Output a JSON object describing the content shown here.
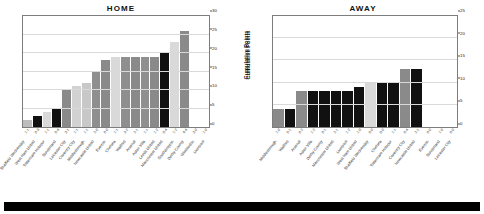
{
  "footer": {
    "bar_color": "#000000"
  },
  "axis": {
    "y_label": "Cumulative Points"
  },
  "chart_data": [
    {
      "type": "bar",
      "title": "HOME",
      "xlabel": "",
      "ylabel": "Cumulative Points",
      "ylim": [
        0,
        30
      ],
      "yticks": [
        0,
        5,
        10,
        15,
        20,
        25,
        30
      ],
      "grid": true,
      "legend": "none",
      "categories": [
        "Sheffield Wednesday",
        "West Ham United",
        "Tottenham Hotspur",
        "Sunderland",
        "Leicester City",
        "Coventry City",
        "Middlesbrough",
        "Newcastle United",
        "Everton",
        "Chelsea",
        "Watford",
        "Arsenal",
        "Aston Villa",
        "Leeds United",
        "Manchester United",
        "Southampton",
        "Derby County",
        "Wimbledon",
        "Liverpool"
      ],
      "scores": [
        "1-1",
        "0-3",
        "1-1",
        "0-4",
        "3-1",
        "1-1",
        "1-1",
        "2-0",
        "0-0",
        "1-1",
        "3-2",
        "2-1",
        "1-1",
        "1-2",
        "0-4",
        "1-2",
        "4-4",
        "3-0",
        "1-0"
      ],
      "values": [
        2,
        3,
        4,
        5,
        10,
        11,
        12,
        15,
        18,
        19,
        19,
        19,
        19,
        19,
        20,
        23,
        26,
        0,
        0
      ],
      "bar_colors": [
        "#bdbdbd",
        "#111111",
        "#d9d9d9",
        "#111111",
        "#8a8a8a",
        "#d2d2d2",
        "#c8c8c8",
        "#8f8f8f",
        "#8a8a8a",
        "#d9d9d9",
        "#8f8f8f",
        "#8a8a8a",
        "#8f8f8f",
        "#8a8a8a",
        "#111111",
        "#d9d9d9",
        "#8a8a8a",
        "#8f8f8f",
        "#8a8a8a"
      ]
    },
    {
      "type": "bar",
      "title": "AWAY",
      "xlabel": "",
      "ylabel": "Cumulative Points",
      "ylim": [
        0,
        25
      ],
      "yticks": [
        0,
        5,
        10,
        15,
        20,
        25
      ],
      "grid": true,
      "legend": "none",
      "categories": [
        "Middlesbrough",
        "Watford",
        "Arsenal",
        "Aston Villa",
        "Derby County",
        "Manchester United",
        "Liverpool",
        "West Ham United",
        "Sheffield Wednesday",
        "Chelsea",
        "Tottenham Hotspur",
        "Coventry City",
        "Newcastle United",
        "Everton",
        "Sunderland",
        "Leicester City"
      ],
      "scores": [
        "1-0",
        "0-1",
        "0-2",
        "1-2",
        "0-1",
        "2-1",
        "1-2",
        "1-0",
        "0-0",
        "0-0",
        "1-1",
        "0-4",
        "2-1",
        "0-0",
        "1-0",
        "0-0"
      ],
      "values": [
        4,
        4,
        8,
        8,
        8,
        8,
        8,
        9,
        10,
        10,
        10,
        13,
        13,
        0,
        0,
        0
      ],
      "bar_colors": [
        "#8a8a8a",
        "#111111",
        "#8a8a8a",
        "#111111",
        "#111111",
        "#111111",
        "#111111",
        "#111111",
        "#d9d9d9",
        "#111111",
        "#111111",
        "#8a8a8a",
        "#111111",
        "#d9d9d9",
        "#8a8a8a",
        "#111111"
      ]
    }
  ]
}
